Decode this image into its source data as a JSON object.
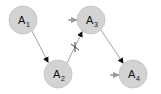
{
  "diagram": {
    "type": "directed-graph",
    "colors": {
      "node_fill": "#d3d3d3",
      "node_stroke": "#bdbdbd",
      "edge": "#7a7a7a",
      "arrowhead": "#111111",
      "input_arrow": "#9a9a9a"
    },
    "nodes": [
      {
        "id": "A1",
        "base": "A",
        "sub": "1",
        "cx": 23,
        "cy": 20
      },
      {
        "id": "A2",
        "base": "A",
        "sub": "2",
        "cx": 58,
        "cy": 74
      },
      {
        "id": "A3",
        "base": "A",
        "sub": "3",
        "cx": 91,
        "cy": 20
      },
      {
        "id": "A4",
        "base": "A",
        "sub": "4",
        "cx": 133,
        "cy": 74
      }
    ],
    "edges": [
      {
        "from": "A1",
        "to": "A2",
        "blocked": false
      },
      {
        "from": "A2",
        "to": "A3",
        "blocked": true,
        "marker": "x"
      },
      {
        "from": "A3",
        "to": "A4",
        "blocked": false
      }
    ],
    "external_inputs": [
      {
        "to": "A3",
        "color": "gray"
      },
      {
        "to": "A4",
        "color": "gray"
      }
    ]
  }
}
